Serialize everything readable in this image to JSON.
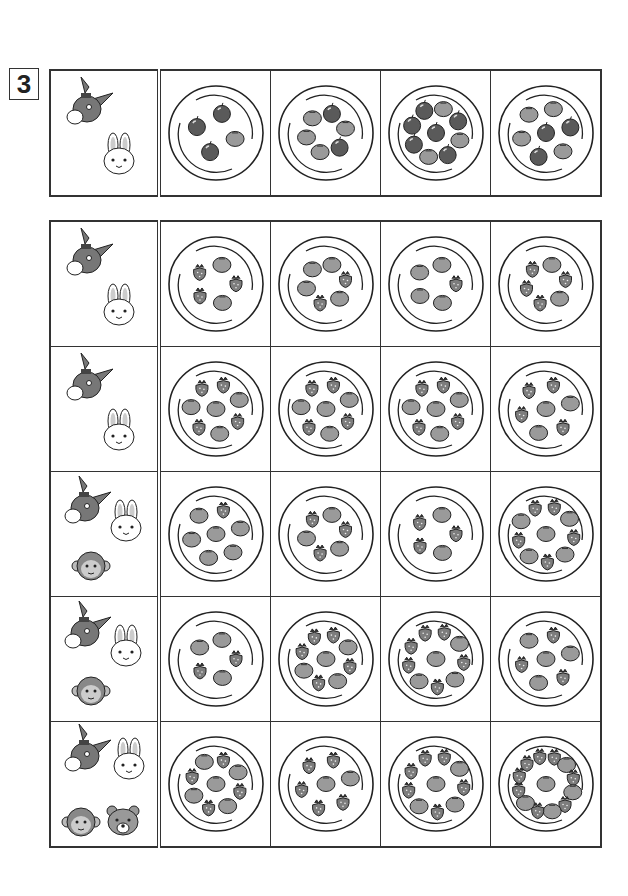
{
  "question_number": "3",
  "example": {
    "animals": [
      "donkey",
      "rabbit"
    ],
    "plates": [
      {
        "apples": 3,
        "oranges": 1
      },
      {
        "apples": 2,
        "oranges": 4
      },
      {
        "apples": 6,
        "oranges": 3
      },
      {
        "apples": 3,
        "oranges": 4
      }
    ]
  },
  "rows": [
    {
      "animals": [
        "donkey",
        "rabbit"
      ],
      "plates": [
        {
          "oranges": 2,
          "strawberries": 3
        },
        {
          "oranges": 4,
          "strawberries": 2
        },
        {
          "oranges": 4,
          "strawberries": 1
        },
        {
          "oranges": 2,
          "strawberries": 4
        }
      ]
    },
    {
      "animals": [
        "donkey",
        "rabbit"
      ],
      "plates": [
        {
          "oranges": 4,
          "strawberries": 4
        },
        {
          "oranges": 4,
          "strawberries": 4
        },
        {
          "oranges": 4,
          "strawberries": 4
        },
        {
          "oranges": 3,
          "strawberries": 4
        }
      ]
    },
    {
      "animals": [
        "donkey",
        "rabbit",
        "monkey"
      ],
      "plates": [
        {
          "oranges": 6,
          "strawberries": 1
        },
        {
          "oranges": 3,
          "strawberries": 3
        },
        {
          "oranges": 2,
          "strawberries": 3
        },
        {
          "oranges": 5,
          "strawberries": 5
        }
      ]
    },
    {
      "animals": [
        "donkey",
        "rabbit",
        "monkey"
      ],
      "plates": [
        {
          "oranges": 3,
          "strawberries": 2
        },
        {
          "oranges": 4,
          "strawberries": 5
        },
        {
          "oranges": 4,
          "strawberries": 6
        },
        {
          "oranges": 4,
          "strawberries": 3
        }
      ]
    },
    {
      "animals": [
        "donkey",
        "rabbit",
        "monkey",
        "bear"
      ],
      "plates": [
        {
          "oranges": 5,
          "strawberries": 4
        },
        {
          "oranges": 2,
          "strawberries": 5
        },
        {
          "oranges": 4,
          "strawberries": 6
        },
        {
          "oranges": 5,
          "strawberries": 8
        }
      ]
    }
  ],
  "colors": {
    "line": "#333333",
    "apple": "#5a5a5a",
    "orange": "#9a9a9a",
    "strawberry": "#7d7d7d",
    "animal": "#777777"
  }
}
